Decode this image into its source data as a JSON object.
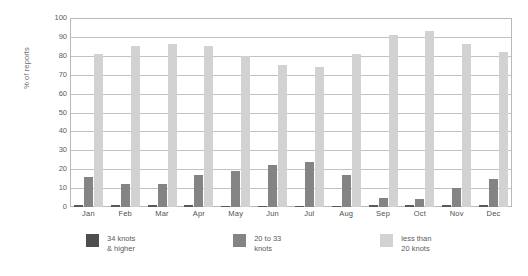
{
  "chart_data": {
    "type": "bar",
    "title": "",
    "xlabel": "",
    "ylabel": "% of reports",
    "ylim": [
      0,
      100
    ],
    "ytick_step": 10,
    "yticks": [
      100,
      90,
      80,
      70,
      60,
      50,
      40,
      30,
      20,
      10,
      0
    ],
    "grid": true,
    "grid_axis": "y",
    "legend_position": "bottom",
    "categories": [
      "Jan",
      "Feb",
      "Mar",
      "Apr",
      "May",
      "Jun",
      "Jul",
      "Aug",
      "Sep",
      "Oct",
      "Nov",
      "Dec"
    ],
    "series": [
      {
        "name": "34 knots & higher",
        "color": "#4e4e4e",
        "values": [
          1,
          1,
          1,
          1,
          0.5,
          0.5,
          0.5,
          0.5,
          1,
          1,
          1,
          1
        ]
      },
      {
        "name": "20 to 33 knots",
        "color": "#848484",
        "values": [
          16,
          12,
          12,
          17,
          19,
          22,
          24,
          17,
          5,
          4,
          10,
          15
        ]
      },
      {
        "name": "less than 20 knots",
        "color": "#d2d2d2",
        "values": [
          81,
          85,
          86,
          85,
          80,
          75,
          74,
          81,
          91,
          93,
          86,
          82
        ]
      }
    ]
  },
  "legend": {
    "items": [
      {
        "line1": "34 knots",
        "line2": "& higher"
      },
      {
        "line1": "20 to 33",
        "line2": "knots"
      },
      {
        "line1": "less than",
        "line2": "20 knots"
      }
    ]
  }
}
